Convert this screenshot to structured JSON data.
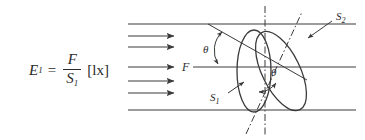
{
  "figure": {
    "background_color": "#ffffff",
    "stroke_color": "#3a3a3a",
    "text_color": "#2b2b2b",
    "formula": {
      "lhs_symbol": "E",
      "lhs_subscript": "1",
      "equals": "=",
      "numerator": "F",
      "denominator_symbol": "S",
      "denominator_subscript": "1",
      "unit": "[lx]",
      "plain": "E1 = F / S1 [lx]"
    },
    "labels": {
      "flux": "F",
      "angle_top": "θ",
      "angle_center": "θ",
      "surface_1_symbol": "S",
      "surface_1_subscript": "1",
      "surface_2_symbol": "S",
      "surface_2_subscript": "2"
    },
    "beam": {
      "arrow_count": 5,
      "top_boundary_y": 24,
      "bottom_boundary_y": 110,
      "arrow_rows_y": [
        36,
        47,
        67,
        81,
        93
      ],
      "arrow_start_x": 128,
      "arrow_end_x": 176,
      "direction": "left-to-right"
    },
    "shapes": {
      "ellipse_s1": {
        "cx": 254,
        "cy": 71,
        "rx": 17,
        "ry": 41,
        "rotation": 0,
        "note": "upright front ellipse, normal incidence surface"
      },
      "ellipse_s2": {
        "cx": 281,
        "cy": 71,
        "rx": 19,
        "ry": 43,
        "rotation": -26,
        "note": "tilted ellipse, inclined surface"
      },
      "axis_vertical": {
        "x": 265,
        "y1": 6,
        "y2": 136,
        "style": "dash-dot"
      },
      "axis_diagonal": {
        "x1": 247,
        "y1": 133,
        "x2": 300,
        "y2": 14,
        "style": "dash-dot"
      },
      "center_horizontal_line": {
        "x1": 176,
        "y1": 67,
        "x2": 356,
        "y2": 67
      },
      "slant_line": {
        "x1": 208,
        "y1": 24,
        "x2": 306,
        "y2": 79
      }
    }
  }
}
